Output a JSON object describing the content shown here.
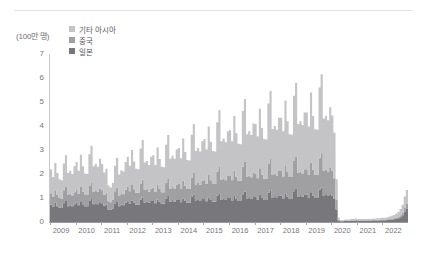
{
  "chart_data": {
    "type": "area",
    "stacked": true,
    "title": "",
    "subtitle": "",
    "xlabel": "",
    "ylabel": "",
    "unit_label": "(100만 명)",
    "ylim": [
      0,
      7
    ],
    "yticks": [
      0,
      1,
      2,
      3,
      4,
      5,
      6,
      7
    ],
    "ytick_labels": [
      "0",
      "1",
      "2",
      "3",
      "4",
      "5",
      "6",
      "7"
    ],
    "xlim": [
      2009,
      2023
    ],
    "xticks": [
      2009,
      2010,
      2011,
      2012,
      2013,
      2014,
      2015,
      2016,
      2017,
      2018,
      2019,
      2020,
      2021,
      2022
    ],
    "xtick_labels": [
      "2009",
      "2010",
      "2011",
      "2012",
      "2013",
      "2014",
      "2015",
      "2016",
      "2017",
      "2018",
      "2019",
      "2020",
      "2021",
      "2022"
    ],
    "grid": false,
    "legend_position": "top-left",
    "colors": {
      "other_asia": "#c4c4c6",
      "china": "#a0a0a3",
      "japan": "#78787c"
    },
    "legend": [
      {
        "label": "기타 아시아",
        "color": "#c4c4c6"
      },
      {
        "label": "중국",
        "color": "#a0a0a3"
      },
      {
        "label": "일본",
        "color": "#78787c"
      }
    ],
    "x": [
      2009.0,
      2009.083,
      2009.167,
      2009.25,
      2009.333,
      2009.417,
      2009.5,
      2009.583,
      2009.667,
      2009.75,
      2009.833,
      2009.917,
      2010.0,
      2010.083,
      2010.167,
      2010.25,
      2010.333,
      2010.417,
      2010.5,
      2010.583,
      2010.667,
      2010.75,
      2010.833,
      2010.917,
      2011.0,
      2011.083,
      2011.167,
      2011.25,
      2011.333,
      2011.417,
      2011.5,
      2011.583,
      2011.667,
      2011.75,
      2011.833,
      2011.917,
      2012.0,
      2012.083,
      2012.167,
      2012.25,
      2012.333,
      2012.417,
      2012.5,
      2012.583,
      2012.667,
      2012.75,
      2012.833,
      2012.917,
      2013.0,
      2013.083,
      2013.167,
      2013.25,
      2013.333,
      2013.417,
      2013.5,
      2013.583,
      2013.667,
      2013.75,
      2013.833,
      2013.917,
      2014.0,
      2014.083,
      2014.167,
      2014.25,
      2014.333,
      2014.417,
      2014.5,
      2014.583,
      2014.667,
      2014.75,
      2014.833,
      2014.917,
      2015.0,
      2015.083,
      2015.167,
      2015.25,
      2015.333,
      2015.417,
      2015.5,
      2015.583,
      2015.667,
      2015.75,
      2015.833,
      2015.917,
      2016.0,
      2016.083,
      2016.167,
      2016.25,
      2016.333,
      2016.417,
      2016.5,
      2016.583,
      2016.667,
      2016.75,
      2016.833,
      2016.917,
      2017.0,
      2017.083,
      2017.167,
      2017.25,
      2017.333,
      2017.417,
      2017.5,
      2017.583,
      2017.667,
      2017.75,
      2017.833,
      2017.917,
      2018.0,
      2018.083,
      2018.167,
      2018.25,
      2018.333,
      2018.417,
      2018.5,
      2018.583,
      2018.667,
      2018.75,
      2018.833,
      2018.917,
      2019.0,
      2019.083,
      2019.167,
      2019.25,
      2019.333,
      2019.417,
      2019.5,
      2019.583,
      2019.667,
      2019.75,
      2019.833,
      2019.917,
      2020.0,
      2020.083,
      2020.167,
      2020.25,
      2020.333,
      2020.417,
      2020.5,
      2020.583,
      2020.667,
      2020.75,
      2020.833,
      2020.917,
      2021.0,
      2021.083,
      2021.167,
      2021.25,
      2021.333,
      2021.417,
      2021.5,
      2021.583,
      2021.667,
      2021.75,
      2021.833,
      2021.917,
      2022.0,
      2022.083,
      2022.167,
      2022.25,
      2022.333,
      2022.417,
      2022.5,
      2022.583,
      2022.667,
      2022.75,
      2022.833,
      2022.917
    ],
    "series": [
      {
        "name": "일본",
        "label": "일본",
        "color": "#78787c",
        "values": [
          0.72,
          0.62,
          0.8,
          0.66,
          0.6,
          0.58,
          0.78,
          0.88,
          0.66,
          0.7,
          0.66,
          0.74,
          0.8,
          0.7,
          0.86,
          0.74,
          0.66,
          0.66,
          0.88,
          0.96,
          0.74,
          0.78,
          0.74,
          0.82,
          0.78,
          0.68,
          0.72,
          0.52,
          0.5,
          0.56,
          0.76,
          0.86,
          0.66,
          0.72,
          0.7,
          0.8,
          0.86,
          0.76,
          0.9,
          0.8,
          0.72,
          0.72,
          0.94,
          1.02,
          0.8,
          0.84,
          0.8,
          0.88,
          0.88,
          0.78,
          0.94,
          0.84,
          0.76,
          0.76,
          0.98,
          1.08,
          0.84,
          0.88,
          0.84,
          0.92,
          0.92,
          0.82,
          0.98,
          0.88,
          0.8,
          0.8,
          1.04,
          1.14,
          0.88,
          0.92,
          0.88,
          0.96,
          0.96,
          0.86,
          1.02,
          0.92,
          0.84,
          0.84,
          1.1,
          1.2,
          0.92,
          0.96,
          0.92,
          1.0,
          1.0,
          0.9,
          1.08,
          0.96,
          0.88,
          0.88,
          1.16,
          1.26,
          0.96,
          1.0,
          0.96,
          1.04,
          1.04,
          0.94,
          1.12,
          1.0,
          0.92,
          0.92,
          1.22,
          1.32,
          1.0,
          1.04,
          1.0,
          1.08,
          1.1,
          0.98,
          1.18,
          1.06,
          0.96,
          0.96,
          1.28,
          1.38,
          1.04,
          1.08,
          1.04,
          1.12,
          1.14,
          1.02,
          1.24,
          1.1,
          1.0,
          1.0,
          1.34,
          1.44,
          1.08,
          1.12,
          1.08,
          1.16,
          1.1,
          0.96,
          0.52,
          0.06,
          0.03,
          0.03,
          0.04,
          0.04,
          0.04,
          0.05,
          0.05,
          0.06,
          0.05,
          0.05,
          0.05,
          0.05,
          0.05,
          0.05,
          0.05,
          0.06,
          0.06,
          0.06,
          0.06,
          0.07,
          0.07,
          0.07,
          0.08,
          0.09,
          0.1,
          0.11,
          0.13,
          0.16,
          0.2,
          0.28,
          0.42,
          0.55
        ]
      },
      {
        "name": "중국",
        "label": "중국",
        "color": "#a0a0a3",
        "values": [
          0.48,
          0.42,
          0.52,
          0.46,
          0.4,
          0.4,
          0.54,
          0.6,
          0.46,
          0.48,
          0.44,
          0.5,
          0.56,
          0.48,
          0.6,
          0.52,
          0.46,
          0.46,
          0.62,
          0.7,
          0.52,
          0.54,
          0.52,
          0.58,
          0.54,
          0.46,
          0.5,
          0.34,
          0.32,
          0.36,
          0.52,
          0.58,
          0.44,
          0.48,
          0.46,
          0.54,
          0.6,
          0.52,
          0.64,
          0.56,
          0.5,
          0.5,
          0.66,
          0.74,
          0.54,
          0.52,
          0.46,
          0.52,
          0.56,
          0.48,
          0.6,
          0.54,
          0.48,
          0.48,
          0.66,
          0.74,
          0.56,
          0.58,
          0.56,
          0.64,
          0.66,
          0.58,
          0.74,
          0.64,
          0.58,
          0.58,
          0.8,
          0.9,
          0.68,
          0.7,
          0.66,
          0.76,
          0.8,
          0.72,
          0.94,
          0.82,
          0.74,
          0.74,
          1.0,
          1.12,
          0.84,
          0.86,
          0.82,
          0.92,
          0.92,
          0.84,
          1.06,
          0.94,
          0.84,
          0.84,
          1.14,
          1.24,
          0.92,
          0.94,
          0.9,
          1.0,
          0.98,
          0.88,
          1.12,
          0.98,
          0.88,
          0.88,
          1.2,
          1.3,
          0.96,
          0.98,
          0.94,
          1.04,
          1.02,
          0.92,
          1.18,
          1.04,
          0.92,
          0.92,
          1.26,
          1.36,
          1.0,
          1.02,
          0.98,
          1.08,
          1.06,
          0.96,
          1.24,
          1.08,
          0.96,
          0.96,
          1.32,
          1.42,
          1.04,
          1.06,
          1.02,
          1.12,
          1.04,
          0.86,
          0.4,
          0.04,
          0.02,
          0.02,
          0.02,
          0.02,
          0.02,
          0.02,
          0.02,
          0.03,
          0.02,
          0.02,
          0.02,
          0.02,
          0.02,
          0.02,
          0.02,
          0.02,
          0.02,
          0.03,
          0.03,
          0.03,
          0.03,
          0.03,
          0.03,
          0.04,
          0.04,
          0.05,
          0.05,
          0.06,
          0.08,
          0.1,
          0.16,
          0.22
        ]
      },
      {
        "name": "기타 아시아",
        "label": "기타 아시아",
        "color": "#c4c4c6",
        "values": [
          1.0,
          0.84,
          1.14,
          0.92,
          0.78,
          0.76,
          1.12,
          1.3,
          0.92,
          0.96,
          0.9,
          1.08,
          1.14,
          0.96,
          1.34,
          1.06,
          0.9,
          0.88,
          1.32,
          1.52,
          1.06,
          1.1,
          1.04,
          1.24,
          1.1,
          0.92,
          1.0,
          0.66,
          0.62,
          0.7,
          1.06,
          1.24,
          0.88,
          0.96,
          0.94,
          1.16,
          1.26,
          1.06,
          1.46,
          1.16,
          1.0,
          0.98,
          1.46,
          1.66,
          1.14,
          1.18,
          1.12,
          1.32,
          1.34,
          1.12,
          1.56,
          1.24,
          1.06,
          1.04,
          1.58,
          1.8,
          1.24,
          1.3,
          1.24,
          1.46,
          1.5,
          1.26,
          1.76,
          1.4,
          1.2,
          1.18,
          1.8,
          2.04,
          1.4,
          1.46,
          1.4,
          1.64,
          1.7,
          1.44,
          2.02,
          1.6,
          1.38,
          1.36,
          2.06,
          2.34,
          1.6,
          1.66,
          1.58,
          1.86,
          1.9,
          1.62,
          2.28,
          1.8,
          1.54,
          1.52,
          2.32,
          2.62,
          1.78,
          1.84,
          1.76,
          2.06,
          2.06,
          1.74,
          2.48,
          1.94,
          1.66,
          1.64,
          2.52,
          2.84,
          1.92,
          1.98,
          1.9,
          2.22,
          2.22,
          1.88,
          2.7,
          2.1,
          1.78,
          1.76,
          2.72,
          3.06,
          2.04,
          2.1,
          2.02,
          2.36,
          2.36,
          2.0,
          2.92,
          2.24,
          1.9,
          1.88,
          2.94,
          3.3,
          2.18,
          2.24,
          2.14,
          2.5,
          2.3,
          1.9,
          0.86,
          0.08,
          0.03,
          0.03,
          0.04,
          0.04,
          0.04,
          0.05,
          0.05,
          0.06,
          0.05,
          0.05,
          0.05,
          0.05,
          0.05,
          0.05,
          0.06,
          0.06,
          0.06,
          0.07,
          0.07,
          0.08,
          0.08,
          0.08,
          0.09,
          0.1,
          0.12,
          0.13,
          0.16,
          0.2,
          0.26,
          0.34,
          0.48,
          0.56
        ]
      }
    ]
  }
}
